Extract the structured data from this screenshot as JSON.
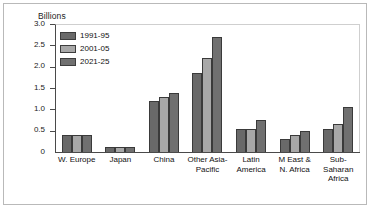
{
  "chart_data": {
    "type": "bar",
    "title": "",
    "subtitle": "",
    "xlabel": "",
    "ylabel": "Billions",
    "ylim": [
      0,
      3.0
    ],
    "yticks": [
      "3.0",
      "2.5",
      "2.0",
      "1.5",
      "1.0",
      "0.5",
      "0"
    ],
    "ytick_values": [
      3.0,
      2.5,
      2.0,
      1.5,
      1.0,
      0.5,
      0
    ],
    "grid": false,
    "legend_position": "top-left",
    "categories": [
      "W. Europe",
      "Japan",
      "China",
      "Other Asia-\nPacific",
      "Latin\nAmerica",
      "M East &\nN. Africa",
      "Sub-\nSaharan\nAfrica"
    ],
    "series": [
      {
        "name": "1991-95",
        "color": "#696969",
        "values": [
          0.4,
          0.11,
          1.2,
          1.85,
          0.55,
          0.3,
          0.55
        ]
      },
      {
        "name": "2001-05",
        "color": "#a8a8a8",
        "values": [
          0.4,
          0.11,
          1.28,
          2.2,
          0.55,
          0.4,
          0.65
        ]
      },
      {
        "name": "2021-25",
        "color": "#707070",
        "values": [
          0.4,
          0.11,
          1.38,
          2.7,
          0.75,
          0.5,
          1.05
        ]
      }
    ]
  },
  "colors": {
    "axis": "#4a4a4a",
    "text": "#111111",
    "frame": "#b9b9b9"
  }
}
